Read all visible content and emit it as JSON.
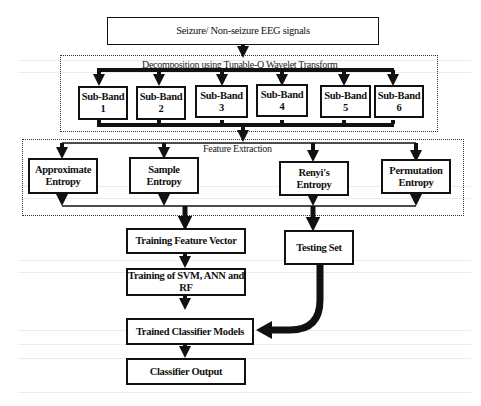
{
  "diagram": {
    "input": "Seizure/ Non-seizure EEG signals",
    "decomposition": {
      "label": "Decomposition using Tunable-Q Wavelet Transform",
      "subbands": [
        "Sub-Band 1",
        "Sub-Band 2",
        "Sub-Band 3",
        "Sub-Band 4",
        "Sub-Band 5",
        "Sub-Band 6"
      ]
    },
    "feature_extraction": {
      "label": "Feature Extraction",
      "features": [
        "Approximate Entropy",
        "Sample Entropy",
        "Renyi's Entropy",
        "Permutation Entropy"
      ]
    },
    "training_feature_vector": "Training Feature Vector",
    "testing_set": "Testing Set",
    "training": "Training of SVM, ANN and RF",
    "trained_models": "Trained Classifier Models",
    "output": "Classifier Output"
  }
}
